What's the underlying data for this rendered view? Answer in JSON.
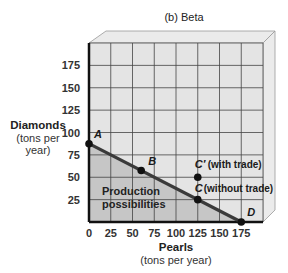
{
  "chart_data": {
    "type": "line",
    "title": "(b) Beta",
    "xlabel": "Pearls",
    "xlabel_sub": "(tons per year)",
    "ylabel": "Diamonds",
    "ylabel_sub": [
      "(tons per",
      "year)"
    ],
    "xlim": [
      0,
      200
    ],
    "ylim": [
      0,
      200
    ],
    "x_ticks": [
      0,
      25,
      50,
      75,
      100,
      125,
      150,
      175
    ],
    "y_ticks": [
      25,
      50,
      75,
      100,
      125,
      150,
      175
    ],
    "grid": true,
    "grid_step": 25,
    "series": [
      {
        "name": "Production possibility frontier",
        "x": [
          0,
          175
        ],
        "y": [
          87.5,
          0
        ]
      }
    ],
    "points": [
      {
        "label": "A",
        "note": "",
        "x": 0,
        "y": 87.5,
        "on_frontier": true
      },
      {
        "label": "B",
        "note": "",
        "x": 60,
        "y": 57.5,
        "on_frontier": true
      },
      {
        "label": "C",
        "note": "(without trade)",
        "x": 125,
        "y": 25,
        "on_frontier": true
      },
      {
        "label": "C′",
        "note": "(with trade)",
        "x": 125,
        "y": 50,
        "on_frontier": false
      },
      {
        "label": "D",
        "note": "",
        "x": 175,
        "y": 0,
        "on_frontier": true
      }
    ],
    "annotations": [
      {
        "text": [
          "Production",
          "possibilities"
        ],
        "region": "below frontier"
      }
    ],
    "colors": {
      "plot_bg": "#e4e4e4",
      "shaded_region": "#c6c6c6",
      "side_face": "#ebebeb",
      "grid": "#444444",
      "frontier": "#3a3a3a",
      "points": "#111111"
    }
  }
}
